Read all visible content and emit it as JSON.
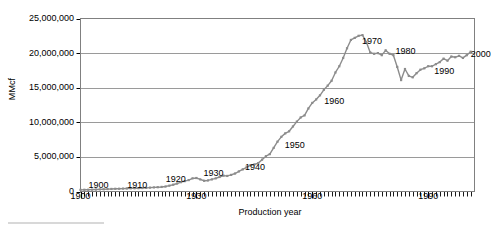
{
  "chart_data": {
    "type": "line",
    "title": "",
    "xlabel": "Production year",
    "ylabel": "MMcf",
    "xlim": [
      1900,
      2002
    ],
    "ylim": [
      0,
      25000000
    ],
    "grid": true,
    "legend": false,
    "y_ticks": [
      {
        "value": 0,
        "label": "0"
      },
      {
        "value": 5000000,
        "label": "5,000,000"
      },
      {
        "value": 10000000,
        "label": "10,000,000"
      },
      {
        "value": 15000000,
        "label": "15,000,000"
      },
      {
        "value": 20000000,
        "label": "20,000,000"
      },
      {
        "value": 25000000,
        "label": "25,000,000"
      }
    ],
    "x_ticks": [
      {
        "value": 1900,
        "label": "1900"
      },
      {
        "value": 1930,
        "label": "1930"
      },
      {
        "value": 1960,
        "label": "1960"
      },
      {
        "value": 1990,
        "label": "1990"
      }
    ],
    "x_minor_tick_interval": 1,
    "series_style": {
      "line_color": "#8c8c8c",
      "marker": "square",
      "marker_color": "#8c8c8c",
      "marker_size": 2.2,
      "line_width": 1.4
    },
    "point_labels": [
      {
        "text": "1900",
        "x": 1900,
        "y": 500000,
        "dx": 8,
        "dy": -2
      },
      {
        "text": "1910",
        "x": 1910,
        "y": 500000,
        "dx": 8,
        "dy": -2
      },
      {
        "text": "1920",
        "x": 1920,
        "y": 800000,
        "dx": 8,
        "dy": -6
      },
      {
        "text": "1930",
        "x": 1930,
        "y": 1900000,
        "dx": 7,
        "dy": -4
      },
      {
        "text": "1940",
        "x": 1940,
        "y": 2600000,
        "dx": 10,
        "dy": -6
      },
      {
        "text": "1950",
        "x": 1950,
        "y": 6300000,
        "dx": 11,
        "dy": -2
      },
      {
        "text": "1960",
        "x": 1960,
        "y": 12800000,
        "dx": 12,
        "dy": -1
      },
      {
        "text": "1970",
        "x": 1970,
        "y": 21900000,
        "dx": 11,
        "dy": 2
      },
      {
        "text": "1980",
        "x": 1980,
        "y": 19900000,
        "dx": 6,
        "dy": -2
      },
      {
        "text": "1990",
        "x": 1990,
        "y": 18100000,
        "dx": 6,
        "dy": 6
      },
      {
        "text": "2000",
        "x": 2000,
        "y": 19700000,
        "dx": 4,
        "dy": 0
      }
    ],
    "x": [
      1900,
      1901,
      1902,
      1903,
      1904,
      1905,
      1906,
      1907,
      1908,
      1909,
      1910,
      1911,
      1912,
      1913,
      1914,
      1915,
      1916,
      1917,
      1918,
      1919,
      1920,
      1921,
      1922,
      1923,
      1924,
      1925,
      1926,
      1927,
      1928,
      1929,
      1930,
      1931,
      1932,
      1933,
      1934,
      1935,
      1936,
      1937,
      1938,
      1939,
      1940,
      1941,
      1942,
      1943,
      1944,
      1945,
      1946,
      1947,
      1948,
      1949,
      1950,
      1951,
      1952,
      1953,
      1954,
      1955,
      1956,
      1957,
      1958,
      1959,
      1960,
      1961,
      1962,
      1963,
      1964,
      1965,
      1966,
      1967,
      1968,
      1969,
      1970,
      1971,
      1972,
      1973,
      1974,
      1975,
      1976,
      1977,
      1978,
      1979,
      1980,
      1981,
      1982,
      1983,
      1984,
      1985,
      1986,
      1987,
      1988,
      1989,
      1990,
      1991,
      1992,
      1993,
      1994,
      1995,
      1996,
      1997,
      1998,
      1999,
      2000,
      2001
    ],
    "values": [
      240000,
      250000,
      260000,
      270000,
      280000,
      300000,
      320000,
      350000,
      370000,
      390000,
      400000,
      420000,
      440000,
      460000,
      470000,
      480000,
      500000,
      520000,
      560000,
      590000,
      620000,
      660000,
      720000,
      840000,
      980000,
      1150000,
      1350000,
      1500000,
      1650000,
      1900000,
      1950000,
      1750000,
      1550000,
      1600000,
      1750000,
      1900000,
      2100000,
      2300000,
      2250000,
      2400000,
      2600000,
      2900000,
      3200000,
      3500000,
      3800000,
      3900000,
      4100000,
      4600000,
      5100000,
      5400000,
      6300000,
      7200000,
      7900000,
      8400000,
      8700000,
      9400000,
      10100000,
      10700000,
      11000000,
      12000000,
      12800000,
      13300000,
      13900000,
      14700000,
      15300000,
      16000000,
      17200000,
      18100000,
      19300000,
      20700000,
      21900000,
      22200000,
      22500000,
      22600000,
      21600000,
      20100000,
      19900000,
      20000000,
      19700000,
      20400000,
      19900000,
      19700000,
      18000000,
      16100000,
      17700000,
      16700000,
      16500000,
      17100000,
      17600000,
      17800000,
      18100000,
      18100000,
      18400000,
      18700000,
      19200000,
      18900000,
      19500000,
      19400000,
      19600000,
      19300000,
      19700000,
      20200000
    ]
  },
  "artifacts": {
    "scan_line": "scan-artifact"
  }
}
